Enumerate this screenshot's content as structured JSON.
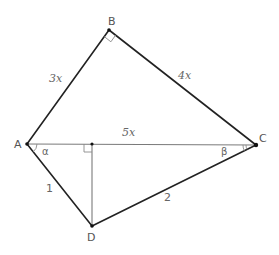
{
  "diagram": {
    "title": "",
    "points": {
      "A": {
        "label": "A",
        "x": 27,
        "y": 144
      },
      "B": {
        "label": "B",
        "x": 109,
        "y": 30
      },
      "C": {
        "label": "C",
        "x": 256,
        "y": 145
      },
      "D": {
        "label": "D",
        "x": 92,
        "y": 226
      },
      "H": {
        "label": "",
        "x": 92,
        "y": 144
      }
    },
    "segments": [
      {
        "from": "A",
        "to": "B",
        "length_label": "3x",
        "style": "thick"
      },
      {
        "from": "B",
        "to": "C",
        "length_label": "4x",
        "style": "thick"
      },
      {
        "from": "A",
        "to": "C",
        "length_label": "5x",
        "style": "thin"
      },
      {
        "from": "A",
        "to": "D",
        "length_label": "1",
        "style": "thick"
      },
      {
        "from": "D",
        "to": "C",
        "length_label": "2",
        "style": "thick"
      },
      {
        "from": "H",
        "to": "D",
        "length_label": "",
        "style": "thin"
      }
    ],
    "labels": {
      "A": "A",
      "B": "B",
      "C": "C",
      "D": "D",
      "AB": "3x",
      "BC": "4x",
      "AC": "5x",
      "AD": "1",
      "DC": "2",
      "alpha": "α",
      "beta": "β"
    },
    "right_angles": [
      "B",
      "H"
    ],
    "angles": [
      {
        "vertex": "A",
        "label": "α",
        "between": [
          "AC",
          "AD"
        ]
      },
      {
        "vertex": "C",
        "label": "β",
        "between": [
          "CA",
          "CD"
        ]
      }
    ],
    "colors": {
      "thick_line": "#222222",
      "thin_line": "#7a7a7a",
      "label": "#555555"
    }
  }
}
